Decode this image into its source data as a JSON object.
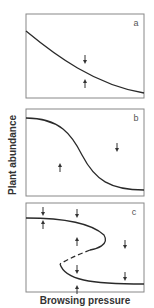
{
  "figure": {
    "ylabel": "Plant abundance",
    "xlabel": "Browsing pressure",
    "panels": [
      {
        "id": "a",
        "label": "a",
        "description": "monotonic gradual decline; arrows converge on single equilibrium curve"
      },
      {
        "id": "b",
        "label": "b",
        "description": "sigmoidal threshold decline; arrows converge on curve"
      },
      {
        "id": "c",
        "label": "c",
        "description": "folded (hysteresis) curve with two stable branches (solid) and unstable middle branch (dashed); arrows show alternate stable states"
      }
    ],
    "colors": {
      "line": "#2a2a2a",
      "border": "#888888",
      "text": "#333333"
    }
  }
}
